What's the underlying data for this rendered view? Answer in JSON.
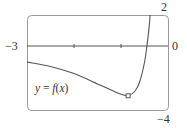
{
  "chart_data": {
    "type": "line",
    "title": "",
    "xlabel": "",
    "ylabel": "",
    "xlim": [
      -3,
      0
    ],
    "ylim": [
      -4,
      2
    ],
    "grid": false,
    "legend": "none",
    "window_labels": {
      "x_min": "−3",
      "x_max": "0",
      "y_max": "2",
      "y_min": "−4"
    },
    "x_ticks": [
      -2,
      -1
    ],
    "series": [
      {
        "name": "y = f(x)",
        "x": [
          -3.0,
          -2.5,
          -2.0,
          -1.5,
          -1.2,
          -1.0,
          -0.85,
          -0.7,
          -0.6,
          -0.5,
          -0.45,
          -0.4,
          -0.38
        ],
        "y": [
          -0.97,
          -1.25,
          -1.7,
          -2.35,
          -2.75,
          -3.0,
          -3.1,
          -2.8,
          -2.2,
          -1.0,
          0.0,
          1.3,
          2.0
        ]
      }
    ],
    "annotations": [
      {
        "type": "marker",
        "shape": "square",
        "x": -0.85,
        "y": -3.1,
        "label": "local minimum"
      },
      {
        "type": "text",
        "text": "y = f(x)",
        "x": -2.75,
        "y": -2.4
      }
    ]
  },
  "labels": {
    "x_min": "−3",
    "x_max": "0",
    "y_max": "2",
    "y_min": "−4",
    "fn_y": "y",
    "fn_eq": " = ",
    "fn_f": "f",
    "fn_open": "(",
    "fn_x": "x",
    "fn_close": ")"
  },
  "colors": {
    "frame": "#8a8a8a",
    "axis": "#555555",
    "curve": "#555555",
    "text": "#333333"
  }
}
